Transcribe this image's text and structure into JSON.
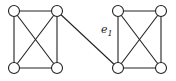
{
  "diagram": {
    "type": "graph",
    "nodes": [
      {
        "id": "a1",
        "x": 14,
        "y": 11
      },
      {
        "id": "a2",
        "x": 57,
        "y": 11
      },
      {
        "id": "a3",
        "x": 14,
        "y": 68
      },
      {
        "id": "a4",
        "x": 57,
        "y": 68
      },
      {
        "id": "b1",
        "x": 118,
        "y": 11
      },
      {
        "id": "b2",
        "x": 161,
        "y": 11
      },
      {
        "id": "b3",
        "x": 118,
        "y": 68
      },
      {
        "id": "b4",
        "x": 161,
        "y": 68
      }
    ],
    "edges": [
      [
        "a1",
        "a2"
      ],
      [
        "a1",
        "a3"
      ],
      [
        "a1",
        "a4"
      ],
      [
        "a2",
        "a3"
      ],
      [
        "a2",
        "a4"
      ],
      [
        "a3",
        "a4"
      ],
      [
        "b1",
        "b2"
      ],
      [
        "b1",
        "b3"
      ],
      [
        "b1",
        "b4"
      ],
      [
        "b2",
        "b3"
      ],
      [
        "b2",
        "b4"
      ],
      [
        "b3",
        "b4"
      ],
      [
        "a2",
        "b3"
      ]
    ],
    "bridge_label": {
      "text": "e",
      "subscript": "1",
      "x": 101,
      "y": 33
    }
  }
}
